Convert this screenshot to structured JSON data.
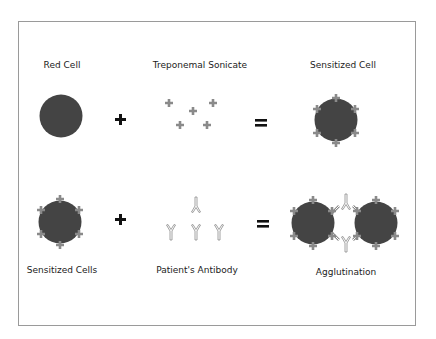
{
  "diagram": {
    "colors": {
      "cell": "#444444",
      "antigen": "#8a8a8a",
      "antibody_stroke": "#888888",
      "operator": "#111111",
      "frame": "#9a9a9a"
    },
    "row1": {
      "labels": [
        "Red Cell",
        "Treponemal Sonicate",
        "Sensitized Cell"
      ],
      "operators": [
        "+",
        "="
      ]
    },
    "row2": {
      "labels": [
        "Sensitized Cells",
        "Patient's Antibody",
        "Agglutination"
      ],
      "operators": [
        "+",
        "="
      ]
    }
  }
}
